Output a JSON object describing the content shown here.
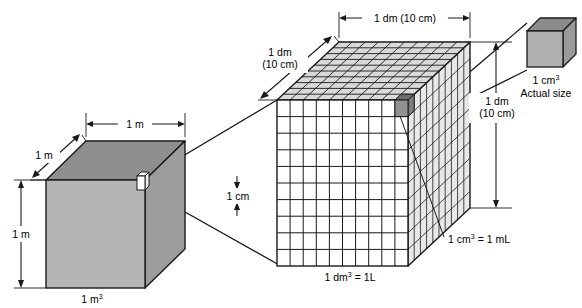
{
  "figure": {
    "colors": {
      "outline": "#1a1a1a",
      "cube_front": "#b5b5b5",
      "cube_top": "#8f8f8f",
      "cube_side": "#9c9c9c",
      "grid_top_fill": "#d9d9d9",
      "grid_side_fill": "#e8e8e8",
      "grid_front_fill": "#ffffff",
      "highlight_cube": "#8a8a8a",
      "small_cube_front": "#b0b0b0",
      "small_cube_top": "#8c8c8c",
      "small_cube_side": "#9a9a9a",
      "background": "#ffffff"
    }
  },
  "meter_cube": {
    "name": "1 m3 cube",
    "width_label": "1 m",
    "depth_label": "1 m",
    "height_label": "1 m",
    "caption": "1 m",
    "caption_sup": "3"
  },
  "decimeter_cube": {
    "name": "1 dm3 grid cube",
    "width_label": "1 dm (10 cm)",
    "depth_label_line1": "1 dm",
    "depth_label_line2": "(10 cm)",
    "height_label_line1": "1 dm",
    "height_label_line2": "(10 cm)",
    "cell_label": "1 cm",
    "bottom_caption": "1 dm",
    "bottom_caption_sup": "3",
    "bottom_caption_rest": " = 1L",
    "callout": "1 cm",
    "callout_sup": "3",
    "callout_rest": " = 1 mL",
    "grid_divisions": 10
  },
  "centimeter_cube": {
    "name": "1 cm3 actual size cube",
    "caption_line1": "1 cm",
    "caption_line1_sup": "3",
    "caption_line2": "Actual size"
  }
}
